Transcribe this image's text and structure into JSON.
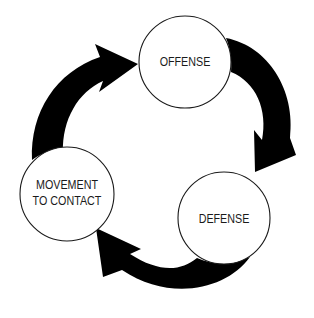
{
  "diagram": {
    "type": "cycle",
    "background": "#ffffff",
    "arrow_color": "#000000",
    "circle_stroke": "#1a1a1a",
    "text_color": "#1a1a1a",
    "nodes": [
      {
        "id": "offense",
        "label_lines": [
          "OFFENSE"
        ]
      },
      {
        "id": "defense",
        "label_lines": [
          "DEFENSE"
        ]
      },
      {
        "id": "movement-to-contact",
        "label_lines": [
          "MOVEMENT",
          "TO CONTACT"
        ]
      }
    ],
    "edges": [
      {
        "from": "offense",
        "to": "defense",
        "direction": "clockwise"
      },
      {
        "from": "defense",
        "to": "movement-to-contact",
        "direction": "clockwise"
      },
      {
        "from": "movement-to-contact",
        "to": "offense",
        "direction": "clockwise"
      }
    ]
  }
}
